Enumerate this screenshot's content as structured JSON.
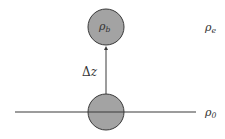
{
  "diagram": {
    "type": "physics-schematic",
    "colors": {
      "parcel_fill": "#a3a3a3",
      "parcel_stroke": "#3a3a3a",
      "line": "#3a3a3a",
      "text": "#333333"
    },
    "labels": {
      "parcel_top_symbol": "ρ",
      "parcel_top_sub": "b",
      "environment_symbol": "ρ",
      "environment_sub": "e",
      "reference_symbol": "ρ",
      "reference_sub": "0",
      "displacement_delta": "Δ",
      "displacement_var": "z"
    }
  }
}
